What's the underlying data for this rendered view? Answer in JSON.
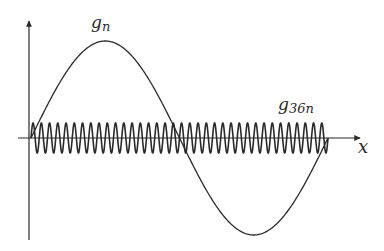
{
  "diagram": {
    "type": "function-plot",
    "axes": {
      "x_label": "x",
      "y_label": ""
    },
    "curves": [
      {
        "name": "g_n",
        "label_base": "g",
        "label_sub": "n",
        "cycles": 1,
        "amplitude_px": 97
      },
      {
        "name": "g_36n",
        "label_base": "g",
        "label_sub": "36n",
        "cycles": 36,
        "amplitude_px": 15
      }
    ],
    "colors": {
      "stroke": "#2a2a2a",
      "background": "#ffffff"
    }
  }
}
